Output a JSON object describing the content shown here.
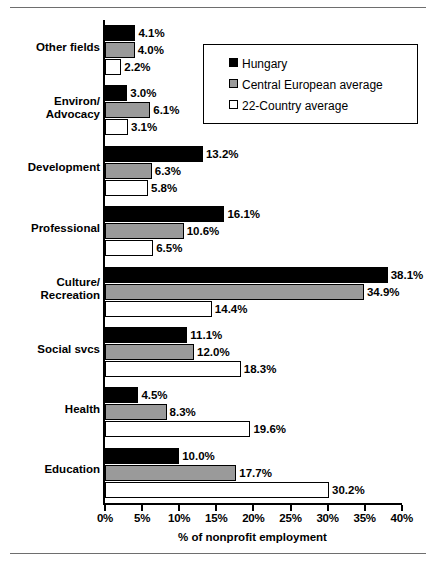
{
  "chart_data": {
    "type": "bar",
    "orientation": "horizontal",
    "title": "",
    "xlabel": "% of nonprofit employment",
    "ylabel": "",
    "xlim": [
      0,
      40
    ],
    "xticks": [
      "0%",
      "5%",
      "10%",
      "15%",
      "20%",
      "25%",
      "30%",
      "35%",
      "40%"
    ],
    "xtick_values": [
      0,
      5,
      10,
      15,
      20,
      25,
      30,
      35,
      40
    ],
    "grid": false,
    "legend_position": "top-right",
    "categories": [
      "Other fields",
      "Environ/\nAdvocacy",
      "Development",
      "Professional",
      "Culture/\nRecreation",
      "Social svcs",
      "Health",
      "Education"
    ],
    "category_lines": [
      [
        "Other fields"
      ],
      [
        "Environ/",
        "Advocacy"
      ],
      [
        "Development"
      ],
      [
        "Professional"
      ],
      [
        "Culture/",
        "Recreation"
      ],
      [
        "Social svcs"
      ],
      [
        "Health"
      ],
      [
        "Education"
      ]
    ],
    "series": [
      {
        "name": "Hungary",
        "color": "#000000",
        "values": [
          4.1,
          3.0,
          13.2,
          16.1,
          38.1,
          11.1,
          4.5,
          10.0
        ],
        "labels": [
          "4.1%",
          "3.0%",
          "13.2%",
          "16.1%",
          "38.1%",
          "11.1%",
          "4.5%",
          "10.0%"
        ]
      },
      {
        "name": "Central European average",
        "color": "#9a9a9a",
        "values": [
          4.0,
          6.1,
          6.3,
          10.6,
          34.9,
          12.0,
          8.3,
          17.7
        ],
        "labels": [
          "4.0%",
          "6.1%",
          "6.3%",
          "10.6%",
          "34.9%",
          "12.0%",
          "8.3%",
          "17.7%"
        ]
      },
      {
        "name": "22-Country average",
        "color": "#ffffff",
        "values": [
          2.2,
          3.1,
          5.8,
          6.5,
          14.4,
          18.3,
          19.6,
          30.2
        ],
        "labels": [
          "2.2%",
          "3.1%",
          "5.8%",
          "6.5%",
          "14.4%",
          "18.3%",
          "19.6%",
          "30.2%"
        ]
      }
    ]
  },
  "legend": {
    "items": [
      {
        "label": "Hungary"
      },
      {
        "label": "Central European average"
      },
      {
        "label": "22-Country average"
      }
    ]
  }
}
